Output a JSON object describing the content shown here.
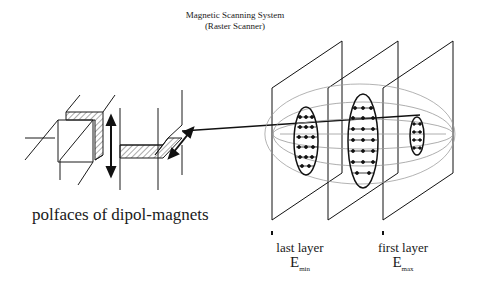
{
  "diagram": {
    "title_line1": "Magnetic Scanning System",
    "title_line2": "(Raster Scanner)",
    "magnets_label": "polfaces of dipol-magnets",
    "layers": [
      {
        "label": "last layer",
        "energy": "E",
        "energy_sub": "min"
      },
      {
        "label": "first layer",
        "energy": "E",
        "energy_sub": "max"
      }
    ],
    "elements": {
      "dipole_magnets": 2,
      "scan_arrows": 2,
      "beam_line": 1,
      "layer_planes": 3,
      "target_volume": "ellipsoid",
      "scanned_spots_per_layer": [
        "dot grid",
        "dot grid",
        "dot grid"
      ]
    },
    "colors": {
      "line": "#1a1a1a",
      "background": "#ffffff",
      "hatch": "#555555"
    }
  }
}
